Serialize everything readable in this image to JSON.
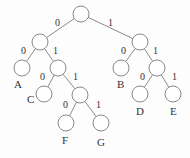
{
  "tree": {
    "nodes": [
      {
        "id": "root",
        "x": 81,
        "y": 14
      },
      {
        "id": "n0",
        "x": 40,
        "y": 42
      },
      {
        "id": "n1",
        "x": 140,
        "y": 42
      },
      {
        "id": "A",
        "x": 22,
        "y": 68,
        "label": "A",
        "lx": 14,
        "ly": 88
      },
      {
        "id": "n01",
        "x": 58,
        "y": 68
      },
      {
        "id": "B",
        "x": 121,
        "y": 68,
        "label": "B",
        "lx": 117,
        "ly": 88
      },
      {
        "id": "n11",
        "x": 157,
        "y": 68
      },
      {
        "id": "C",
        "x": 44,
        "y": 94,
        "label": "C",
        "lx": 27,
        "ly": 103
      },
      {
        "id": "n011",
        "x": 80,
        "y": 95
      },
      {
        "id": "D",
        "x": 140,
        "y": 94,
        "label": "D",
        "lx": 136,
        "ly": 115
      },
      {
        "id": "E",
        "x": 173,
        "y": 94,
        "label": "E",
        "lx": 170,
        "ly": 115
      },
      {
        "id": "F",
        "x": 66,
        "y": 123,
        "label": "F",
        "lx": 62,
        "ly": 144
      },
      {
        "id": "G",
        "x": 101,
        "y": 123,
        "label": "G",
        "lx": 97,
        "ly": 146
      }
    ],
    "edges": [
      {
        "from": "root",
        "to": "n0",
        "bit": "0",
        "bx": 55,
        "by": 26
      },
      {
        "from": "root",
        "to": "n1",
        "bit": "1",
        "bx": 108,
        "by": 26
      },
      {
        "from": "n0",
        "to": "A",
        "bit": "0",
        "bx": 21,
        "by": 54
      },
      {
        "from": "n0",
        "to": "n01",
        "bit": "1",
        "bx": 53,
        "by": 54
      },
      {
        "from": "n1",
        "to": "B",
        "bit": "0",
        "bx": 121,
        "by": 54
      },
      {
        "from": "n1",
        "to": "n11",
        "bit": "1",
        "bx": 153,
        "by": 54
      },
      {
        "from": "n01",
        "to": "C",
        "bit": "0",
        "bx": 40,
        "by": 80
      },
      {
        "from": "n01",
        "to": "n011",
        "bit": "1",
        "bx": 73,
        "by": 80
      },
      {
        "from": "n11",
        "to": "D",
        "bit": "0",
        "bx": 140,
        "by": 80
      },
      {
        "from": "n11",
        "to": "E",
        "bit": "1",
        "bx": 172,
        "by": 80
      },
      {
        "from": "n011",
        "to": "F",
        "bit": "0",
        "bx": 63,
        "by": 108
      },
      {
        "from": "n011",
        "to": "G",
        "bit": "1",
        "bx": 96,
        "by": 108
      }
    ],
    "radius": 8
  }
}
